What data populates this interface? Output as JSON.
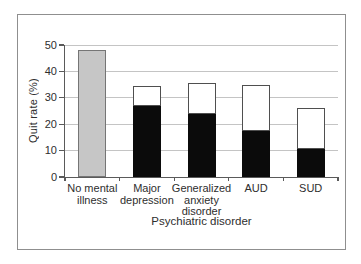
{
  "chart_data": {
    "type": "bar",
    "variant": "stacked",
    "title": "",
    "xlabel": "Psychiatric disorder",
    "ylabel": "Quit rate (%)",
    "ylim": [
      0,
      50
    ],
    "yticks": [
      0,
      10,
      20,
      30,
      40,
      50
    ],
    "grid": "horizontal",
    "legend": "none",
    "categories": [
      "No mental illness",
      "Major depression",
      "Generalized anxiety disorder",
      "AUD",
      "SUD"
    ],
    "bars": [
      {
        "category": "No mental illness",
        "label_lines": [
          "No mental",
          "illness"
        ],
        "total": 48,
        "segments": [
          {
            "series": "no-mental-illness",
            "value": 48,
            "fill": "#c6c6c6",
            "stroke": "#757575"
          }
        ]
      },
      {
        "category": "Major depression",
        "label_lines": [
          "Major",
          "depression"
        ],
        "total": 34.5,
        "segments": [
          {
            "series": "black",
            "value": 27,
            "fill": "#0b0b0b",
            "stroke": "#0b0b0b"
          },
          {
            "series": "white",
            "value": 7.5,
            "fill": "#ffffff",
            "stroke": "#4f4f4f"
          }
        ]
      },
      {
        "category": "Generalized anxiety disorder",
        "label_lines": [
          "Generalized",
          "anxiety",
          "disorder"
        ],
        "total": 35.5,
        "segments": [
          {
            "series": "black",
            "value": 24,
            "fill": "#0b0b0b",
            "stroke": "#0b0b0b"
          },
          {
            "series": "white",
            "value": 11.5,
            "fill": "#ffffff",
            "stroke": "#4f4f4f"
          }
        ]
      },
      {
        "category": "AUD",
        "label_lines": [
          "AUD"
        ],
        "total": 35,
        "segments": [
          {
            "series": "black",
            "value": 17.5,
            "fill": "#0b0b0b",
            "stroke": "#0b0b0b"
          },
          {
            "series": "white",
            "value": 17.5,
            "fill": "#ffffff",
            "stroke": "#4f4f4f"
          }
        ]
      },
      {
        "category": "SUD",
        "label_lines": [
          "SUD"
        ],
        "total": 26,
        "segments": [
          {
            "series": "black",
            "value": 10.5,
            "fill": "#0b0b0b",
            "stroke": "#0b0b0b"
          },
          {
            "series": "white",
            "value": 15.5,
            "fill": "#ffffff",
            "stroke": "#4f4f4f"
          }
        ]
      }
    ],
    "colors": {
      "gridline": "#c4c4c4",
      "axis": "#5a5a5a",
      "text": "#2e2e2e",
      "frame_border": "#8f8f8f",
      "background": "#ffffff",
      "gray_bar_fill": "#c6c6c6",
      "black_bar_fill": "#0b0b0b",
      "white_bar_fill": "#ffffff"
    }
  }
}
